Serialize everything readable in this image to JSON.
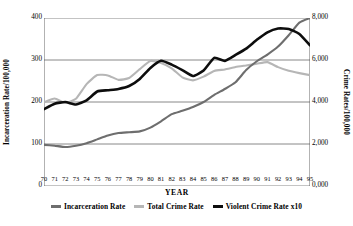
{
  "chart_data": {
    "type": "line",
    "title": "",
    "xlabel": "YEAR",
    "ylabel": "Incarceration Rate/100,000",
    "y2label": "Crime Rates/100,000",
    "grid": true,
    "legend_position": "bottom",
    "x": [
      70,
      71,
      72,
      73,
      74,
      75,
      76,
      77,
      78,
      79,
      80,
      81,
      82,
      83,
      84,
      85,
      86,
      87,
      88,
      89,
      90,
      91,
      92,
      93,
      94,
      95
    ],
    "categories": [
      "70",
      "71",
      "72",
      "73",
      "74",
      "75",
      "76",
      "77",
      "78",
      "79",
      "80",
      "81",
      "82",
      "83",
      "84",
      "85",
      "86",
      "87",
      "88",
      "89",
      "90",
      "91",
      "92",
      "93",
      "94",
      "95"
    ],
    "ylim": [
      0,
      400
    ],
    "yticks": [
      0,
      100,
      200,
      300,
      400
    ],
    "ytick_labels": [
      "0",
      "100",
      "200",
      "300",
      "400"
    ],
    "y2lim": [
      0,
      8000
    ],
    "y2ticks": [
      0,
      2000,
      4000,
      6000,
      8000
    ],
    "y2tick_labels": [
      "0,000",
      "2,000",
      "4,000",
      "6,000",
      "8,000"
    ],
    "series": [
      {
        "name": "Incarceration Rate",
        "color": "#6e6e6e",
        "axis": "left",
        "values": [
          98,
          96,
          93,
          96,
          102,
          111,
          120,
          126,
          128,
          130,
          139,
          154,
          171,
          179,
          188,
          200,
          217,
          231,
          247,
          276,
          297,
          313,
          332,
          359,
          389,
          400
        ]
      },
      {
        "name": "Total Crime Rate",
        "color": "#b6b6b6",
        "axis": "right",
        "values": [
          3985,
          4165,
          3961,
          4154,
          4850,
          5282,
          5266,
          5055,
          5140,
          5565,
          5950,
          5858,
          5604,
          5175,
          5031,
          5207,
          5480,
          5550,
          5664,
          5741,
          5820,
          5898,
          5660,
          5484,
          5374,
          5278
        ]
      },
      {
        "name": "Violent Crime Rate x10",
        "color": "#0d0d0d",
        "axis": "left",
        "values": [
          183,
          196,
          200,
          194,
          204,
          225,
          228,
          231,
          238,
          255,
          281,
          298,
          289,
          276,
          262,
          275,
          305,
          298,
          312,
          327,
          348,
          366,
          375,
          374,
          362,
          335
        ]
      }
    ]
  },
  "legend": {
    "items": [
      {
        "label": "Incarceration Rate",
        "color": "#6e6e6e"
      },
      {
        "label": "Total Crime Rate",
        "color": "#b6b6b6"
      },
      {
        "label": "Violent Crime Rate x10",
        "color": "#0d0d0d"
      }
    ]
  },
  "axes": {
    "x_title": "YEAR",
    "y_left_title": "Incarceration Rate/100,000",
    "y_right_title": "Crime Rates/100,000"
  },
  "style": {
    "axis_color": "#555555",
    "grid_color": "#6a6a6a",
    "background": "#ffffff"
  }
}
